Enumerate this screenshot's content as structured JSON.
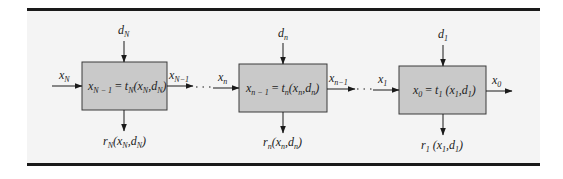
{
  "diagram": {
    "stages": [
      {
        "id": "stage-N",
        "box_equation": {
          "lhs": "x",
          "lhs_sub": "N − 1",
          "eq": " = ",
          "fn": "t",
          "fn_sub": "N",
          "args": "(x",
          "arg1_sub": "N",
          "sep": ",d",
          "arg2_sub": "N",
          "close": ")"
        },
        "input_state": {
          "var": "x",
          "sub": "N"
        },
        "decision": {
          "var": "d",
          "sub": "N"
        },
        "output_state": {
          "var": "x",
          "sub": "N−1"
        },
        "return": {
          "fn": "r",
          "fn_sub": "N",
          "args": "(x",
          "arg1_sub": "N",
          "sep": ",d",
          "arg2_sub": "N",
          "close": ")"
        }
      },
      {
        "id": "stage-n",
        "box_equation": {
          "lhs": "x",
          "lhs_sub": "n − 1",
          "eq": " = ",
          "fn": "t",
          "fn_sub": "n",
          "args": "(x",
          "arg1_sub": "n",
          "sep": ",d",
          "arg2_sub": "n",
          "close": ")"
        },
        "input_state": {
          "var": "x",
          "sub": "n"
        },
        "decision": {
          "var": "d",
          "sub": "n"
        },
        "output_state": {
          "var": "x",
          "sub": "n−1"
        },
        "return": {
          "fn": "r",
          "fn_sub": "n",
          "args": "(x",
          "arg1_sub": "n",
          "sep": ",d",
          "arg2_sub": "n",
          "close": ")"
        }
      },
      {
        "id": "stage-1",
        "box_equation": {
          "lhs": "x",
          "lhs_sub": "0",
          "eq": " = ",
          "fn": "t",
          "fn_sub": "1",
          "args": " (x",
          "arg1_sub": "1",
          "sep": ",d",
          "arg2_sub": "1",
          "close": ")"
        },
        "input_state": {
          "var": "x",
          "sub": "1"
        },
        "decision": {
          "var": "d",
          "sub": "1"
        },
        "output_state": {
          "var": "x",
          "sub": "0"
        },
        "return": {
          "fn": "r",
          "fn_sub": "1",
          "args": " (x",
          "arg1_sub": "1",
          "sep": ",d",
          "arg2_sub": "1",
          "close": ")"
        }
      }
    ],
    "colors": {
      "panel_background": "#f4f4f4",
      "box_fill": "#c9c9c9",
      "box_stroke": "#3a3a3a",
      "rules": "#1a1a1a"
    }
  }
}
